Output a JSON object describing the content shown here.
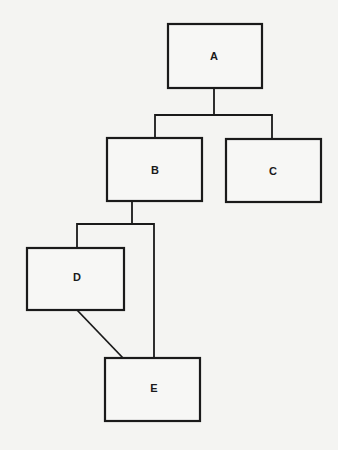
{
  "diagram": {
    "type": "hierarchy",
    "nodes": [
      {
        "id": "A",
        "label": "A",
        "x": 168,
        "y": 24,
        "w": 94,
        "h": 64
      },
      {
        "id": "B",
        "label": "B",
        "x": 107,
        "y": 138,
        "w": 95,
        "h": 63
      },
      {
        "id": "C",
        "label": "C",
        "x": 226,
        "y": 139,
        "w": 95,
        "h": 63
      },
      {
        "id": "D",
        "label": "D",
        "x": 27,
        "y": 248,
        "w": 97,
        "h": 62
      },
      {
        "id": "E",
        "label": "E",
        "x": 105,
        "y": 358,
        "w": 95,
        "h": 63
      }
    ],
    "edges": [
      {
        "from": "A",
        "to": "B"
      },
      {
        "from": "A",
        "to": "C"
      },
      {
        "from": "B",
        "to": "D"
      },
      {
        "from": "B",
        "to": "E"
      },
      {
        "from": "D",
        "to": "E"
      }
    ]
  }
}
